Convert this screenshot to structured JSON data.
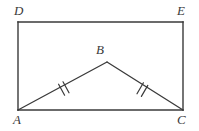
{
  "figure": {
    "kind": "geometry-diagram",
    "stroke_color": "#3a3a3a",
    "background_color": "#ffffff",
    "labels": {
      "D": "D",
      "E": "E",
      "B": "B",
      "A": "A",
      "C": "C"
    },
    "points": {
      "A": {
        "x": 18,
        "y": 110
      },
      "B": {
        "x": 107,
        "y": 62
      },
      "C": {
        "x": 183,
        "y": 110
      },
      "D": {
        "x": 18,
        "y": 22
      },
      "E": {
        "x": 183,
        "y": 22
      }
    },
    "rectangle": {
      "name": "ADEC",
      "left": 18,
      "top": 22,
      "right": 183,
      "bottom": 110
    },
    "segments": [
      {
        "name": "DE",
        "from": "D",
        "to": "E",
        "ticks": 0
      },
      {
        "name": "EC",
        "from": "E",
        "to": "C",
        "ticks": 0
      },
      {
        "name": "CA",
        "from": "C",
        "to": "A",
        "ticks": 0
      },
      {
        "name": "AD",
        "from": "A",
        "to": "D",
        "ticks": 0
      },
      {
        "name": "AB",
        "from": "A",
        "to": "B",
        "ticks": 2
      },
      {
        "name": "BC",
        "from": "B",
        "to": "C",
        "ticks": 2
      }
    ],
    "tick_marks": {
      "count_per_segment": 2,
      "meaning": "congruent-segments",
      "AB_center": {
        "x": 64,
        "y": 87
      },
      "BC_center": {
        "x": 142,
        "y": 88
      }
    }
  }
}
